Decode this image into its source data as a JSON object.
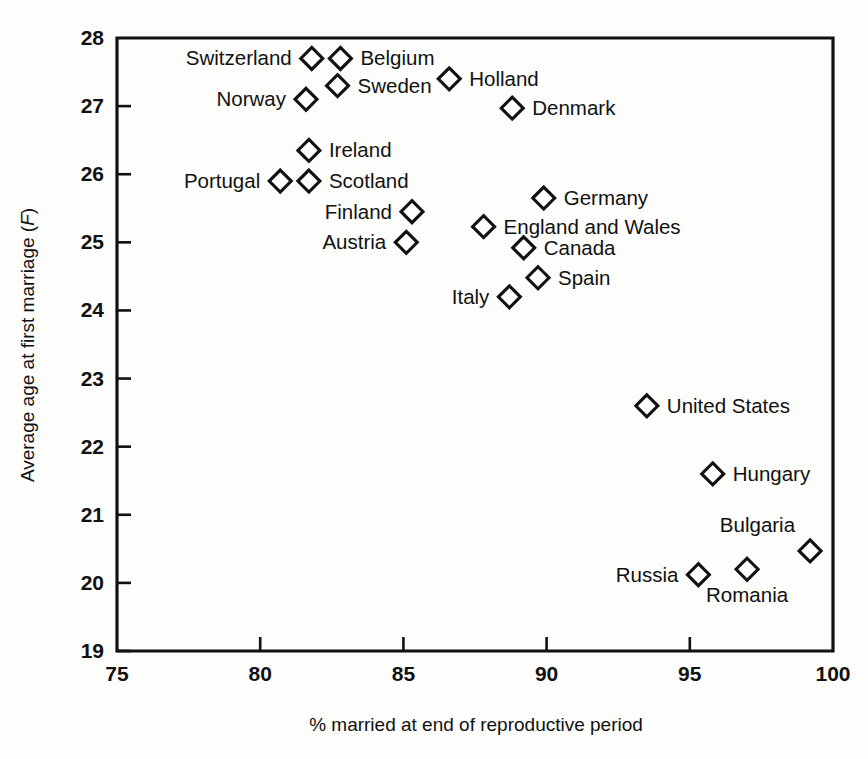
{
  "chart_data": {
    "type": "scatter",
    "title": "",
    "xlabel": "% married at end of reproductive period",
    "ylabel": "Average age at first marriage (F)",
    "ylabel_plain": "Average age at first marriage",
    "ylabel_italic": "F",
    "xlim": [
      75,
      100
    ],
    "ylim": [
      19,
      28
    ],
    "xticks": [
      75,
      80,
      85,
      90,
      95,
      100
    ],
    "yticks": [
      19,
      20,
      21,
      22,
      23,
      24,
      25,
      26,
      27,
      28
    ],
    "grid": false,
    "legend": "none",
    "marker_style": "open-diamond",
    "points": [
      {
        "name": "Switzerland",
        "x": 81.8,
        "y": 27.7,
        "label_side": "left"
      },
      {
        "name": "Belgium",
        "x": 82.8,
        "y": 27.7,
        "label_side": "right"
      },
      {
        "name": "Sweden",
        "x": 82.7,
        "y": 27.3,
        "label_side": "right"
      },
      {
        "name": "Norway",
        "x": 81.6,
        "y": 27.1,
        "label_side": "left"
      },
      {
        "name": "Holland",
        "x": 86.6,
        "y": 27.4,
        "label_side": "right"
      },
      {
        "name": "Denmark",
        "x": 88.8,
        "y": 26.97,
        "label_side": "right"
      },
      {
        "name": "Ireland",
        "x": 81.7,
        "y": 26.35,
        "label_side": "right"
      },
      {
        "name": "Portugal",
        "x": 80.7,
        "y": 25.9,
        "label_side": "left"
      },
      {
        "name": "Scotland",
        "x": 81.7,
        "y": 25.9,
        "label_side": "right"
      },
      {
        "name": "Finland",
        "x": 85.3,
        "y": 25.45,
        "label_side": "left"
      },
      {
        "name": "Austria",
        "x": 85.1,
        "y": 25.0,
        "label_side": "left"
      },
      {
        "name": "Germany",
        "x": 89.9,
        "y": 25.65,
        "label_side": "right"
      },
      {
        "name": "England and Wales",
        "x": 87.8,
        "y": 25.23,
        "label_side": "right"
      },
      {
        "name": "Canada",
        "x": 89.2,
        "y": 24.92,
        "label_side": "right"
      },
      {
        "name": "Spain",
        "x": 89.7,
        "y": 24.48,
        "label_side": "right"
      },
      {
        "name": "Italy",
        "x": 88.7,
        "y": 24.2,
        "label_side": "left"
      },
      {
        "name": "United States",
        "x": 93.5,
        "y": 22.6,
        "label_side": "right"
      },
      {
        "name": "Hungary",
        "x": 95.8,
        "y": 21.6,
        "label_side": "right"
      },
      {
        "name": "Bulgaria",
        "x": 99.2,
        "y": 20.47,
        "label_side": "left-above"
      },
      {
        "name": "Romania",
        "x": 97.0,
        "y": 20.2,
        "label_side": "below"
      },
      {
        "name": "Russia",
        "x": 95.3,
        "y": 20.12,
        "label_side": "left"
      }
    ]
  },
  "colors": {
    "background": "#fdfdfc",
    "ink": "#111111",
    "marker_fill": "#ffffff"
  }
}
